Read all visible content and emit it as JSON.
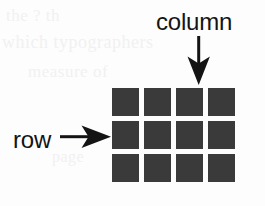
{
  "figure": {
    "type": "grid-annotation-diagram",
    "background_color": "#fdfdfd",
    "ink_color": "#141414",
    "cell_color": "#3a3a3a",
    "grid": {
      "columns": 4,
      "rows": 3,
      "cells": [
        [
          "cell-r1c1",
          "cell-r1c2",
          "cell-r1c3",
          "cell-r1c4"
        ],
        [
          "cell-r2c1",
          "cell-r2c2",
          "cell-r2c3",
          "cell-r2c4"
        ],
        [
          "cell-r3c1",
          "cell-r3c2",
          "cell-r3c3",
          "cell-r3c4"
        ]
      ]
    },
    "annotations": {
      "column": {
        "label": "column",
        "arrow_icon": "arrow-down-icon",
        "arrow_direction": "down",
        "points_at": "column-3"
      },
      "row": {
        "label": "row",
        "arrow_icon": "arrow-right-icon",
        "arrow_direction": "right",
        "points_at": "row-2"
      }
    },
    "ghost_text": {
      "line_1": "the  ?  th",
      "line_2": "which typographers",
      "line_3": "measure of",
      "line_4": "page"
    }
  }
}
